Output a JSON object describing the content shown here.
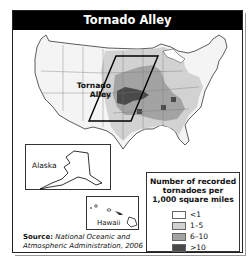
{
  "title": "Tornado Alley",
  "map": {
    "region_label": "Tornado Alley",
    "insets": [
      {
        "name": "Alaska",
        "label": "Alaska"
      },
      {
        "name": "Hawaii",
        "label": "Hawaii"
      }
    ]
  },
  "legend": {
    "title": "Number of recorded tornadoes per 1,000 square miles",
    "title_lines": [
      "Number of recorded",
      "tornadoes per",
      "1,000 square miles"
    ],
    "items": [
      {
        "label": "<1",
        "color": "#ffffff"
      },
      {
        "label": "1–5",
        "color": "#d2d2d2"
      },
      {
        "label": "6–10",
        "color": "#a3a3a3"
      },
      {
        "label": ">10",
        "color": "#4a4a4a"
      }
    ]
  },
  "source": {
    "label": "Source:",
    "text_line1": "National Oceanic and",
    "text_line2": "Atmospheric Administration, 2006"
  }
}
